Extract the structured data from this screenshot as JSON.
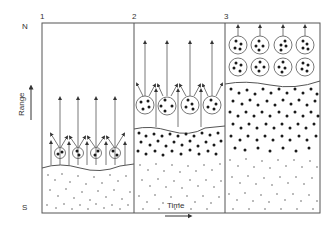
{
  "diagram": {
    "panels": [
      {
        "label": "1"
      },
      {
        "label": "2"
      },
      {
        "label": "3"
      }
    ],
    "y_axis": {
      "label": "Range",
      "top_label": "N",
      "bottom_label": "S"
    },
    "x_axis": {
      "label": "Time"
    },
    "colors": {
      "line": "#555555",
      "dot": "#1a1a1a",
      "background": "#ffffff"
    }
  }
}
